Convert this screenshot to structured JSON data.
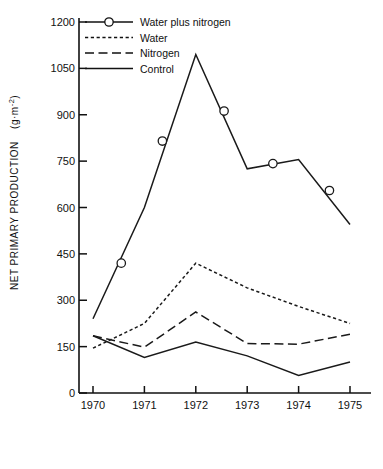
{
  "chart_data": {
    "type": "line",
    "title": "",
    "xlabel": "",
    "ylabel": "NET PRIMARY PRODUCTION  (g·m⁻²)",
    "ylabel_main": "NET PRIMARY PRODUCTION",
    "ylabel_units_pre": "(g·m",
    "ylabel_units_sup": "-2",
    "ylabel_units_post": ")",
    "x": [
      1970,
      1971,
      1972,
      1973,
      1974,
      1975
    ],
    "categories": [
      "1970",
      "1971",
      "1972",
      "1973",
      "1974",
      "1975"
    ],
    "xlim": [
      1969.6,
      1975.4
    ],
    "ylim": [
      0,
      1260
    ],
    "yticks": [
      0,
      150,
      300,
      450,
      600,
      750,
      900,
      1050,
      1200
    ],
    "ytick_labels": [
      "0",
      "150",
      "300",
      "450",
      "600",
      "750",
      "900",
      "1050",
      "1200"
    ],
    "xticks": [
      1970,
      1971,
      1972,
      1973,
      1974,
      1975
    ],
    "xtick_labels": [
      "1970",
      "1971",
      "1972",
      "1973",
      "1974",
      "1975"
    ],
    "grid": false,
    "legend_position": "top-left",
    "series": [
      {
        "name": "Water plus nitrogen",
        "style": "solid-with-circles",
        "color": "#1a1a1a",
        "values": [
          240,
          600,
          1095,
          725,
          755,
          545
        ],
        "markers": [
          {
            "x": 1970.55,
            "y": 420
          },
          {
            "x": 1971.35,
            "y": 815
          },
          {
            "x": 1972.55,
            "y": 912
          },
          {
            "x": 1973.5,
            "y": 742
          },
          {
            "x": 1974.6,
            "y": 655
          }
        ]
      },
      {
        "name": "Water",
        "style": "dotted",
        "color": "#1a1a1a",
        "values": [
          145,
          225,
          420,
          340,
          280,
          225
        ]
      },
      {
        "name": "Nitrogen",
        "style": "dashed",
        "color": "#1a1a1a",
        "values": [
          185,
          148,
          262,
          160,
          158,
          190
        ]
      },
      {
        "name": "Control",
        "style": "solid",
        "color": "#1a1a1a",
        "values": [
          185,
          115,
          165,
          120,
          57,
          100
        ]
      }
    ],
    "legend": [
      {
        "label": "Water plus nitrogen",
        "style": "solid-with-circles"
      },
      {
        "label": "Water",
        "style": "dotted"
      },
      {
        "label": "Nitrogen",
        "style": "dashed"
      },
      {
        "label": "Control",
        "style": "solid"
      }
    ]
  }
}
